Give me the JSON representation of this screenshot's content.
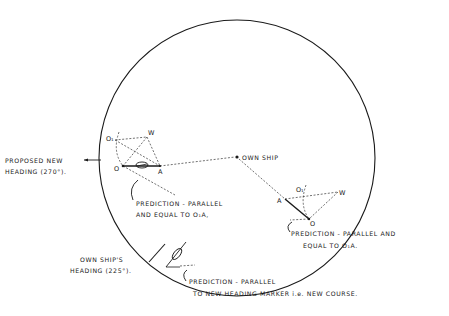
{
  "diagram": {
    "labels": {
      "own_ship": "OWN SHIP",
      "proposed_heading_line1": "PROPOSED NEW",
      "proposed_heading_line2": "HEADING (270°).",
      "pred_left_line1": "PREDICTION - PARALLEL",
      "pred_left_line2": "AND EQUAL TO O₁A,",
      "pred_right_line1": "PREDICTION - PARALLEL AND",
      "pred_right_line2": "EQUAL TO O₁A.",
      "own_heading_line1": "OWN SHIP'S",
      "own_heading_line2": "HEADING (225°).",
      "pred_bottom_line1": "PREDICTION - PARALLEL",
      "pred_bottom_line2": "TO NEW HEADING MARKER i.e. NEW COURSE."
    },
    "points": {
      "left": {
        "o1": "O₁",
        "w": "W",
        "o": "O",
        "a": "A"
      },
      "right": {
        "o1": "O₁",
        "w": "W",
        "o": "O",
        "a": "A"
      }
    }
  }
}
